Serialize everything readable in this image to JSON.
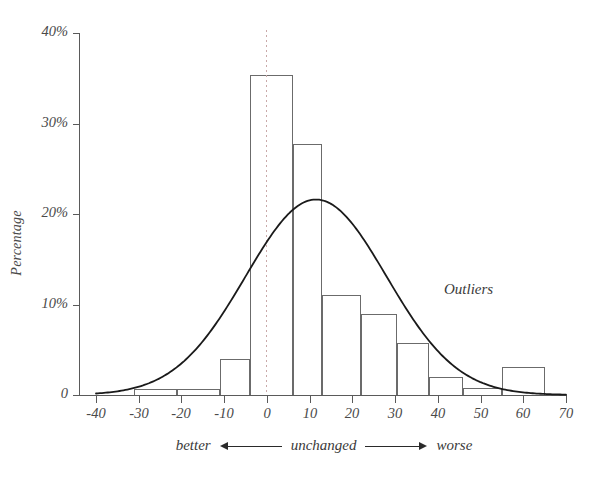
{
  "chart_data": {
    "type": "bar",
    "title": "",
    "xlabel": "",
    "ylabel": "Percentage",
    "xlim": [
      -40,
      70
    ],
    "ylim": [
      0,
      40
    ],
    "grid": false,
    "legend": "none",
    "x_ticks": [
      "-40",
      "-30",
      "-20",
      "-10",
      "0",
      "10",
      "20",
      "30",
      "40",
      "50",
      "60",
      "70"
    ],
    "x_tick_values": [
      -40,
      -30,
      -20,
      -10,
      0,
      10,
      20,
      30,
      40,
      50,
      60,
      70
    ],
    "y_ticks": [
      "0",
      "10%",
      "20%",
      "30%",
      "40%"
    ],
    "y_tick_values": [
      0,
      10,
      20,
      30,
      40
    ],
    "bin_edges": [
      -31,
      -21,
      -11,
      -4,
      6,
      13,
      22,
      30.5,
      38,
      46,
      55,
      65
    ],
    "bars": [
      {
        "x0": -31,
        "x1": -21,
        "value": 0.7
      },
      {
        "x0": -21,
        "x1": -11,
        "value": 0.7
      },
      {
        "x0": -11,
        "x1": -4,
        "value": 4.0
      },
      {
        "x0": -4,
        "x1": 6,
        "value": 35.4
      },
      {
        "x0": 6,
        "x1": 13,
        "value": 27.7
      },
      {
        "x0": 13,
        "x1": 22,
        "value": 11.1
      },
      {
        "x0": 22,
        "x1": 30.5,
        "value": 8.9
      },
      {
        "x0": 30.5,
        "x1": 38,
        "value": 5.8
      },
      {
        "x0": 38,
        "x1": 46,
        "value": 2.0
      },
      {
        "x0": 46,
        "x1": 55,
        "value": 0.8
      },
      {
        "x0": 55,
        "x1": 65,
        "value": 3.1
      }
    ],
    "fit_curve": {
      "name": "normal-density-fit",
      "mean": 11.5,
      "sigma": 16.5,
      "peak_value": 21.6,
      "x_start": -40,
      "x_end": 70
    },
    "reference_line": {
      "name": "zero-line",
      "x": 0,
      "style": "dotted",
      "color": "#c9a9a9"
    },
    "annotations": [
      {
        "name": "outliers",
        "text": "Outliers",
        "x": 55,
        "y": 14.5
      }
    ]
  },
  "axes": {
    "y_title": "Percentage"
  },
  "direction_legend": {
    "left_label": "better",
    "center_label": "unchanged",
    "right_label": "worse"
  }
}
